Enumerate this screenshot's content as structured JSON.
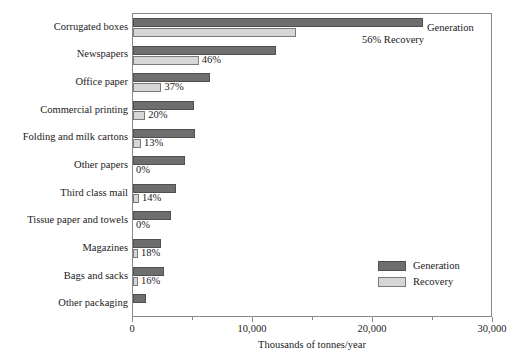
{
  "chart_data": {
    "type": "bar",
    "orientation": "horizontal",
    "title": "",
    "xlabel": "Thousands of tonnes/year",
    "ylabel": "",
    "xlim": [
      0,
      30000
    ],
    "xticks": [
      0,
      10000,
      20000,
      30000
    ],
    "xtick_labels": [
      "0",
      "10,000",
      "20,000",
      "30,000"
    ],
    "minor_xticks": [
      5000,
      15000,
      25000
    ],
    "grid": false,
    "legend_position": "lower right",
    "categories": [
      "Corrugated boxes",
      "Newspapers",
      "Office paper",
      "Commercial printing",
      "Folding and milk cartons",
      "Other papers",
      "Third class mail",
      "Tissue paper and towels",
      "Magazines",
      "Bags and sacks",
      "Other packaging"
    ],
    "series": [
      {
        "name": "Generation",
        "color": "#6e6e6e",
        "values": [
          24200,
          11900,
          6400,
          5100,
          5200,
          4300,
          3600,
          3200,
          2300,
          2600,
          1100
        ]
      },
      {
        "name": "Recovery",
        "color": "#d6d6d6",
        "values": [
          13550,
          5470,
          2370,
          1020,
          676,
          0,
          504,
          0,
          414,
          416,
          0
        ]
      }
    ],
    "recovery_rate_labels": [
      "56%",
      "46%",
      "37%",
      "20%",
      "13%",
      "0%",
      "14%",
      "0%",
      "18%",
      "16%",
      ""
    ],
    "annotations": [
      {
        "text": "Generation",
        "target": "corrugated-boxes-generation-bar-end"
      },
      {
        "text": "56% Recovery",
        "target": "corrugated-boxes-recovery-bar-end"
      }
    ]
  },
  "legend": {
    "items": [
      {
        "label": "Generation",
        "color": "#6e6e6e"
      },
      {
        "label": "Recovery",
        "color": "#d6d6d6"
      }
    ]
  },
  "axis": {
    "x_title": "Thousands of tonnes/year",
    "tick_labels": [
      "0",
      "10,000",
      "20,000",
      "30,000"
    ]
  },
  "annotations": {
    "generation": "Generation",
    "recovery_pct": "56% Recovery"
  }
}
